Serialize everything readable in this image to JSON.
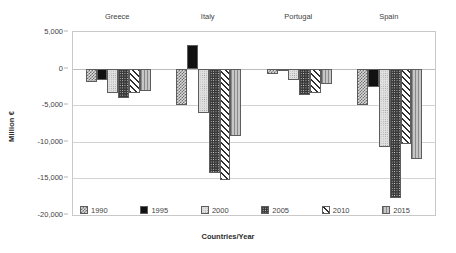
{
  "chart_data": {
    "type": "bar",
    "title": "",
    "xlabel": "Countries/Year",
    "ylabel": "Million €",
    "categories": [
      "Greece",
      "Italy",
      "Portugal",
      "Spain"
    ],
    "ylim": [
      -20000,
      5000
    ],
    "ytick_labels": [
      "5,000",
      "0",
      "-5,000",
      "-10,000",
      "-15,000",
      "-20,000"
    ],
    "ytick_values": [
      5000,
      0,
      -5000,
      -10000,
      -15000,
      -20000
    ],
    "grid": true,
    "legend_position": "bottom-inside",
    "series": [
      {
        "name": "1990",
        "pattern": "checkered",
        "values": [
          -1800,
          -5000,
          -800,
          -5000
        ]
      },
      {
        "name": "1995",
        "pattern": "solid-black",
        "values": [
          -1600,
          3200,
          -100,
          -2500
        ]
      },
      {
        "name": "2000",
        "pattern": "light-dotted",
        "values": [
          -3400,
          -6000,
          -1500,
          -10700
        ]
      },
      {
        "name": "2005",
        "pattern": "dark-dotted",
        "values": [
          -4000,
          -14300,
          -3600,
          -17700
        ]
      },
      {
        "name": "2010",
        "pattern": "diagonal-stripes",
        "values": [
          -3300,
          -15200,
          -3300,
          -10300
        ]
      },
      {
        "name": "2015",
        "pattern": "gray-vertical-lines",
        "values": [
          -3100,
          -9200,
          -2100,
          -12400
        ]
      }
    ]
  },
  "colors": {
    "frame": "#c9c9c9",
    "gridline": "#d3d3d3",
    "text": "#3f3f3f",
    "series_1990": "#d9d9d9",
    "series_1995": "#111111",
    "series_2000": "#e0e0e0",
    "series_2005": "#3a3a3a",
    "series_2010": "#ffffff",
    "series_2015": "#b5b5b5"
  }
}
